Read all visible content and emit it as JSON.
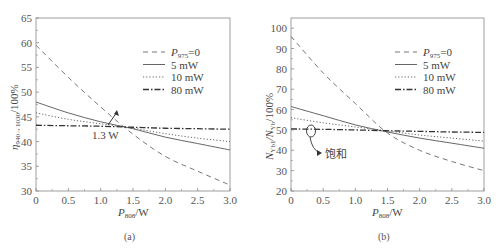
{
  "chart_data": [
    {
      "panel": "(a)",
      "type": "line",
      "xlabel": "P808/W",
      "xlabel_main": "P",
      "xlabel_sub": "808",
      "xlabel_unit": "/W",
      "ylabel": "η940→1030/100%",
      "ylabel_main": "η",
      "ylabel_sub": "940→1030",
      "ylabel_unit": "/100%",
      "xlim": [
        0,
        3.0
      ],
      "ylim": [
        30,
        65
      ],
      "xticks": [
        "0",
        "0.5",
        "1.0",
        "1.5",
        "2.0",
        "2.5",
        "3.0"
      ],
      "yticks": [
        "30",
        "35",
        "40",
        "45",
        "50",
        "55",
        "60",
        "65"
      ],
      "grid": false,
      "legend_position": "upper right",
      "x": [
        0,
        0.5,
        1.0,
        1.5,
        2.0,
        2.5,
        3.0
      ],
      "series": [
        {
          "name": "P975=0",
          "style": "dashed",
          "values": [
            59.5,
            53.0,
            47.0,
            41.5,
            37.0,
            34.0,
            31.2
          ]
        },
        {
          "name": "5 mW",
          "style": "solid",
          "values": [
            48.0,
            45.8,
            44.0,
            42.6,
            40.9,
            39.6,
            38.3
          ]
        },
        {
          "name": "10 mW",
          "style": "dotted",
          "values": [
            45.8,
            44.5,
            43.6,
            42.7,
            41.6,
            40.7,
            40.0
          ]
        },
        {
          "name": "80 mW",
          "style": "dash-dot",
          "values": [
            43.3,
            43.2,
            43.1,
            42.9,
            42.7,
            42.6,
            42.5
          ]
        }
      ],
      "annotations": [
        {
          "text": "1.3 W",
          "x": 1.3,
          "y": 42.8
        }
      ]
    },
    {
      "panel": "(b)",
      "type": "line",
      "xlabel": "P808/W",
      "xlabel_main": "P",
      "xlabel_sub": "808",
      "xlabel_unit": "/W",
      "ylabel": "NYb1/NYb/100%",
      "ylabel_main1": "N",
      "ylabel_sub1": "Yb1",
      "ylabel_main2": "/N",
      "ylabel_sub2": "Yb",
      "ylabel_unit": "/100%",
      "xlim": [
        0,
        3.0
      ],
      "ylim": [
        20,
        105
      ],
      "xticks": [
        "0",
        "0.5",
        "1.0",
        "1.5",
        "2.0",
        "2.5",
        "3.0"
      ],
      "yticks": [
        "20",
        "30",
        "40",
        "50",
        "60",
        "70",
        "80",
        "90",
        "100"
      ],
      "grid": false,
      "legend_position": "upper right",
      "x": [
        0,
        0.5,
        1.0,
        1.5,
        2.0,
        2.5,
        3.0
      ],
      "series": [
        {
          "name": "P975=0",
          "style": "dashed",
          "values": [
            96.0,
            78.0,
            63.0,
            48.5,
            40.0,
            34.5,
            30.0
          ]
        },
        {
          "name": "5 mW",
          "style": "solid",
          "values": [
            61.5,
            57.0,
            52.5,
            49.0,
            46.0,
            43.5,
            41.0
          ]
        },
        {
          "name": "10 mW",
          "style": "dotted",
          "values": [
            56.0,
            53.5,
            51.5,
            49.5,
            47.5,
            46.0,
            44.5
          ]
        },
        {
          "name": "80 mW",
          "style": "dash-dot",
          "values": [
            50.5,
            50.3,
            50.0,
            49.6,
            49.3,
            49.0,
            48.8
          ]
        }
      ],
      "annotations": [
        {
          "text": "饱和",
          "x": 0.3,
          "y": 50
        }
      ]
    }
  ],
  "legend": {
    "entries": [
      {
        "main": "P",
        "sub": "975",
        "suffix": "=0"
      },
      {
        "label": "5 mW"
      },
      {
        "label": "10 mW"
      },
      {
        "label": "80 mW"
      }
    ]
  },
  "panels": {
    "a_label": "(a)",
    "b_label": "(b)",
    "a_annotation": "1.3 W",
    "b_annotation": "饱和"
  },
  "colors": {
    "axis": "#888888",
    "dashed": "#777777",
    "solid": "#666666",
    "dotted": "#666666",
    "dashdot": "#333333"
  }
}
